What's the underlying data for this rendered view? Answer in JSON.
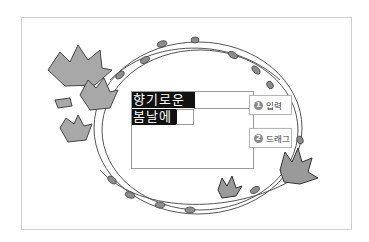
{
  "canvas": {
    "text_lines": [
      "향기로운",
      "봄날에"
    ]
  },
  "callouts": [
    {
      "number": "1",
      "label": "입력"
    },
    {
      "number": "2",
      "label": "드래그"
    }
  ],
  "colors": {
    "highlight": "#111111",
    "callout_badge": "#8a8a8a",
    "frame_border": "#cfcfcf"
  }
}
